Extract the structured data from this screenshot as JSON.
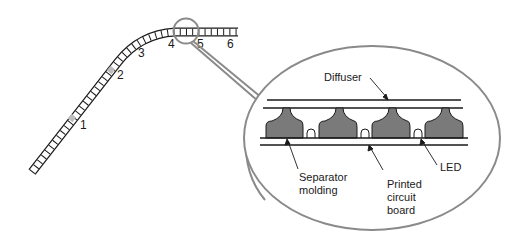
{
  "diagram": {
    "strip": {
      "position_labels": [
        {
          "id": "1",
          "text": "1"
        },
        {
          "id": "2",
          "text": "2"
        },
        {
          "id": "3",
          "text": "3"
        },
        {
          "id": "4",
          "text": "4"
        },
        {
          "id": "5",
          "text": "5"
        },
        {
          "id": "6",
          "text": "6"
        }
      ]
    },
    "callout": {
      "labels": {
        "diffuser": "Diffuser",
        "separator_line1": "Separator",
        "separator_line2": "molding",
        "pcb_line1": "Printed",
        "pcb_line2": "circuit",
        "pcb_line3": "board",
        "led": "LED"
      }
    },
    "colors": {
      "line": "#1a1a1a",
      "outline_gray": "#8a8a8a",
      "separator_fill": "#7a7a7a",
      "cell_fill": "#ffffff"
    }
  }
}
